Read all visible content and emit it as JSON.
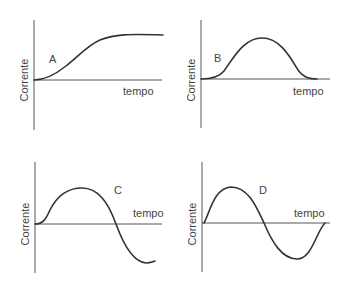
{
  "figure": {
    "panels": [
      {
        "id": "A",
        "letter": "A",
        "ylabel": "Corrente",
        "xlabel": "tempo",
        "shape": "sigmoid-rise-to-plateau"
      },
      {
        "id": "B",
        "letter": "B",
        "ylabel": "Corrente",
        "xlabel": "tempo",
        "shape": "single-positive-bump"
      },
      {
        "id": "C",
        "letter": "C",
        "ylabel": "Corrente",
        "xlabel": "tempo",
        "shape": "positive-lobe-then-negative-lobe"
      },
      {
        "id": "D",
        "letter": "D",
        "ylabel": "Corrente",
        "xlabel": "tempo",
        "shape": "full-sine-cycle"
      }
    ]
  },
  "colors": {
    "axis": "#555555",
    "curve": "#333333",
    "text": "#444444"
  }
}
